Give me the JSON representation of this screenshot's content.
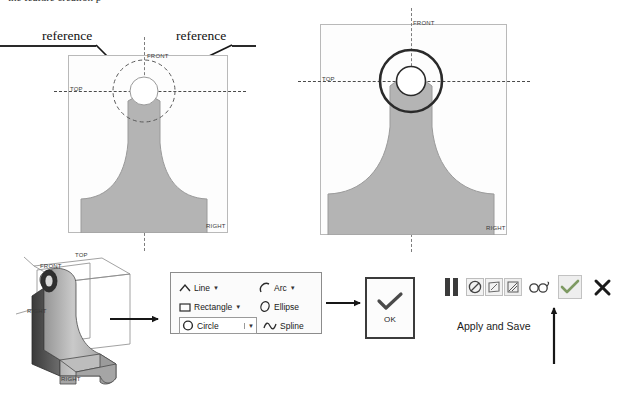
{
  "page": {
    "top_cut_text": "the feature creation p",
    "background": "#ffffff"
  },
  "annotations": {
    "reference_left": "reference",
    "reference_right": "reference",
    "apply_and_save": "Apply and Save"
  },
  "drawing_left": {
    "name": "sketch-view-before",
    "labels": {
      "front": "FRONT",
      "top": "TOP",
      "right": "RIGHT"
    },
    "part_fill": "#b3b3b3",
    "outline": "#8f8f8f",
    "hole_fill": "#ffffff",
    "construction_circle": "dashed"
  },
  "drawing_right": {
    "name": "sketch-view-after",
    "labels": {
      "front": "FRONT",
      "top": "TOP",
      "right": "RIGHT"
    },
    "part_fill": "#b3b3b3",
    "outline": "#8f8f8f",
    "hole_fill": "#ffffff",
    "circle_stroke": "#2a2a2a"
  },
  "model_3d": {
    "name": "isometric-bracket-model",
    "labels": {
      "top": "TOP",
      "front": "FRONT",
      "right": "RIGHT",
      "side": "RIGHT"
    }
  },
  "sketch_palette": {
    "rows": [
      {
        "left": {
          "label": "Line",
          "icon": "line-icon",
          "has_caret": true,
          "boxed": false
        },
        "right": {
          "label": "Arc",
          "icon": "arc-icon",
          "has_caret": true,
          "boxed": false
        }
      },
      {
        "left": {
          "label": "Rectangle",
          "icon": "rectangle-icon",
          "has_caret": true,
          "boxed": false
        },
        "right": {
          "label": "Ellipse",
          "icon": "ellipse-icon",
          "has_caret": false,
          "boxed": false
        }
      },
      {
        "left": {
          "label": "Circle",
          "icon": "circle-icon",
          "has_caret": true,
          "boxed": true
        },
        "right": {
          "label": "Spline",
          "icon": "spline-icon",
          "has_caret": false,
          "boxed": false
        }
      }
    ]
  },
  "ok_button": {
    "label": "OK",
    "icon": "checkmark-icon"
  },
  "command_bar": {
    "items": [
      {
        "name": "pause-icon",
        "type": "icon",
        "selected": false
      },
      {
        "name": "no-entry-icon",
        "type": "boxed",
        "selected": false
      },
      {
        "name": "sketch-tool-icon",
        "type": "boxed",
        "selected": false
      },
      {
        "name": "section-tool-icon",
        "type": "boxed",
        "selected": true
      },
      {
        "name": "glasses-icon",
        "type": "icon",
        "selected": false
      },
      {
        "name": "checkmark-icon",
        "type": "boxed",
        "selected": true
      },
      {
        "name": "close-x-icon",
        "type": "icon",
        "selected": false
      }
    ],
    "accent_check": "#6f8f55",
    "accent_x": "#1b1b1b"
  }
}
